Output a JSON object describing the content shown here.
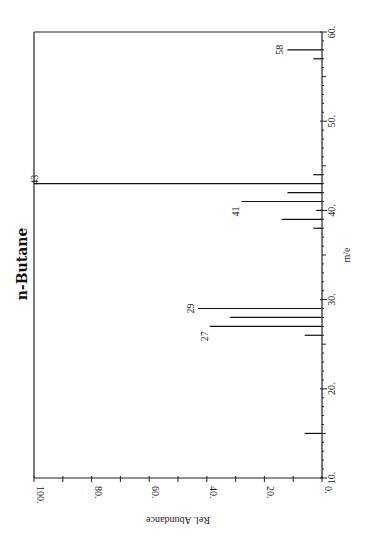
{
  "chart_data": {
    "type": "bar",
    "title": "n-Butane",
    "xlabel": "m/e",
    "ylabel": "Rel. Abundance",
    "xlim": [
      10,
      60
    ],
    "ylim": [
      0,
      100
    ],
    "orientation": "rotated 90° (m/e axis vertical on right, abundance increasing leftward)",
    "x_ticks": [
      "10.",
      "20.",
      "30.",
      "40.",
      "50.",
      "60."
    ],
    "y_ticks": [
      "0.",
      "20.",
      "40.",
      "60.",
      "80.",
      "100."
    ],
    "grid": false,
    "x": [
      15,
      26,
      27,
      28,
      29,
      38,
      39,
      40,
      41,
      42,
      43,
      44,
      57,
      58
    ],
    "values": [
      6,
      6,
      39,
      32,
      43,
      3,
      14,
      2,
      28,
      12,
      100,
      3,
      3,
      12
    ],
    "peak_labels": [
      {
        "mz": 27,
        "text": "27"
      },
      {
        "mz": 29,
        "text": "29"
      },
      {
        "mz": 41,
        "text": "41"
      },
      {
        "mz": 43,
        "text": "43"
      },
      {
        "mz": 58,
        "text": "58"
      }
    ]
  }
}
